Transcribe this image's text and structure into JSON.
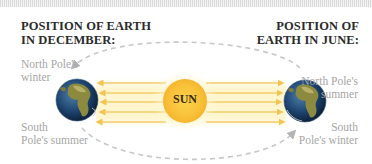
{
  "headings": {
    "december": [
      "POSITION OF EARTH",
      "IN DECEMBER:"
    ],
    "june": [
      "POSITION OF",
      "EARTH IN JUNE:"
    ]
  },
  "labels": {
    "december_north": [
      "North Pole's",
      "winter"
    ],
    "december_south": [
      "South",
      "Pole's summer"
    ],
    "june_north": [
      "North Pole's",
      "summer"
    ],
    "june_south": [
      "South",
      "Pole's winter"
    ]
  },
  "sun": {
    "label": "SUN",
    "color": "#f9c93c",
    "glow": "#fff2b8"
  },
  "earth": {
    "ocean": "#1f4a7a",
    "land": "#8a8a3c"
  },
  "orbit": {
    "color": "#c4c4c4",
    "style": "dashed"
  },
  "rays": {
    "color": "#f6d26a",
    "count": 5
  }
}
